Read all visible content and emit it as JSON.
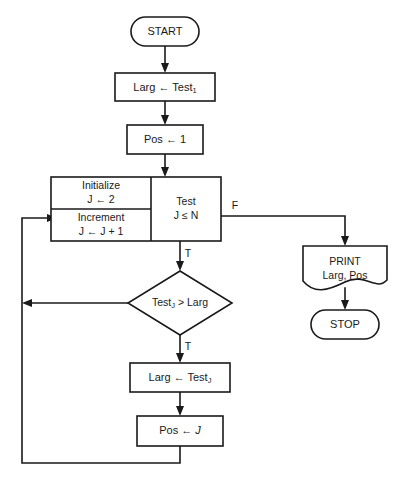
{
  "diagram": {
    "type": "flowchart",
    "background_color": "#ffffff",
    "line_color": "#1a1a1a"
  },
  "nodes": {
    "start": {
      "label": "START",
      "shape": "terminator"
    },
    "init_larg": {
      "label": "Larg ← Test",
      "subscript": "1",
      "shape": "process"
    },
    "init_pos": {
      "label": "Pos ← 1",
      "shape": "process"
    },
    "initialize": {
      "title": "Initialize",
      "body": "J ← 2",
      "shape": "process"
    },
    "increment": {
      "title": "Increment",
      "body": "J ← J + 1",
      "shape": "process"
    },
    "test_loop": {
      "title": "Test",
      "body": "J ≤ N",
      "shape": "loop-test"
    },
    "decision": {
      "label": "Test",
      "subscript": "J",
      "label_tail": "> Larg",
      "shape": "decision"
    },
    "set_larg": {
      "label": "Larg ← Test",
      "subscript": "J",
      "shape": "process"
    },
    "set_pos": {
      "label": "Pos ← ",
      "italic_tail": "J",
      "shape": "process"
    },
    "print": {
      "line1": "PRINT",
      "line2": "Larg, Pos",
      "shape": "document-output"
    },
    "stop": {
      "label": "STOP",
      "shape": "terminator"
    }
  },
  "branch_labels": {
    "test_false": "F",
    "test_true": "T",
    "decision_true": "T"
  }
}
